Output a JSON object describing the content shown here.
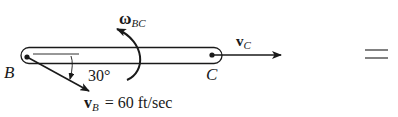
{
  "diagram": {
    "type": "rigid-body-kinematics",
    "body": "bar BC",
    "points": {
      "B": {
        "label": "B"
      },
      "C": {
        "label": "C"
      }
    },
    "angular_velocity": {
      "symbol": "ω",
      "subscript": "BC"
    },
    "velocity_B": {
      "symbol": "v",
      "subscript": "B",
      "equation": "= 60 ft/sec"
    },
    "velocity_C": {
      "symbol": "v",
      "subscript": "C"
    },
    "angle": {
      "value": "30°"
    },
    "equals_sign": "="
  },
  "colors": {
    "ink": "#1a1a1a",
    "background": "#ffffff"
  }
}
